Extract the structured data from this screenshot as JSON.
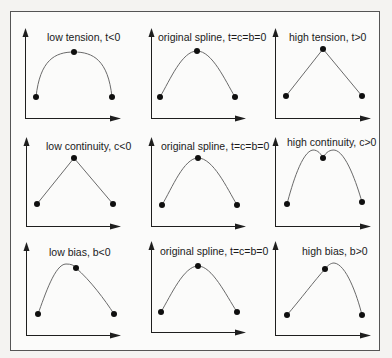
{
  "figure": {
    "frame": {
      "x": 10.5,
      "y": 11.5,
      "w": 369,
      "h": 339
    },
    "colors": {
      "ink": "#1e1e1e",
      "curve": "#6a6a6a",
      "background": "#f4f3f1",
      "frame_fill": "#fbfbfa"
    },
    "panels": [
      {
        "id": "low-tension",
        "label": "low tension, t<0",
        "label_pos": [
          47,
          41
        ],
        "axes": {
          "ox": 25,
          "oy": 118,
          "ytop": 28,
          "xend": 121
        },
        "points": [
          [
            36,
            97
          ],
          [
            74,
            52
          ],
          [
            112,
            97
          ]
        ],
        "curve": "M36,97 C40,60 55,52 74,52 C93,52 108,60 112,97"
      },
      {
        "id": "original-spline-1",
        "label": "original spline, t=c=b=0",
        "label_pos": [
          158,
          41
        ],
        "axes": {
          "ox": 151,
          "oy": 118,
          "ytop": 28,
          "xend": 246
        },
        "points": [
          [
            160,
            97
          ],
          [
            197,
            51
          ],
          [
            235,
            97
          ]
        ],
        "curve": "M160,97 C170,80 182,51 197,51 C212,51 225,80 235,97"
      },
      {
        "id": "high-tension",
        "label": "high tension, t>0",
        "label_pos": [
          289,
          41
        ],
        "axes": {
          "ox": 275,
          "oy": 118,
          "ytop": 28,
          "xend": 371
        },
        "points": [
          [
            286,
            96
          ],
          [
            323,
            49
          ],
          [
            362,
            96
          ]
        ],
        "curve": "M286,96 L323,49 L362,96"
      },
      {
        "id": "low-continuity",
        "label": "low continuity, c<0",
        "label_pos": [
          46,
          150
        ],
        "axes": {
          "ox": 26,
          "oy": 226,
          "ytop": 137,
          "xend": 121
        },
        "points": [
          [
            37,
            204
          ],
          [
            74,
            158
          ],
          [
            113,
            204
          ]
        ],
        "curve": "M37,204 L74,158 L113,204"
      },
      {
        "id": "original-spline-2",
        "label": "original spline, t=c=b=0",
        "label_pos": [
          161,
          150
        ],
        "axes": {
          "ox": 151,
          "oy": 226,
          "ytop": 137,
          "xend": 246
        },
        "points": [
          [
            162,
            205
          ],
          [
            198,
            158
          ],
          [
            237,
            205
          ]
        ],
        "curve": "M162,205 C172,188 184,158 198,158 C213,158 227,188 237,205"
      },
      {
        "id": "high-continuity",
        "label": "high continuity, c>0",
        "label_pos": [
          287,
          146
        ],
        "axes": {
          "ox": 275,
          "oy": 226,
          "ytop": 137,
          "xend": 371
        },
        "points": [
          [
            287,
            204
          ],
          [
            323,
            158
          ],
          [
            362,
            202
          ]
        ],
        "curve": "M287,204 C292,185 302,151 313,150 C318,150 321,154 323,158 C325,154 328,150 334,150 C346,151 357,185 362,202"
      },
      {
        "id": "low-bias",
        "label": "low bias, b<0",
        "label_pos": [
          49,
          256
        ],
        "axes": {
          "ox": 26,
          "oy": 335,
          "ytop": 242,
          "xend": 121
        },
        "points": [
          [
            38,
            314
          ],
          [
            76,
            268
          ],
          [
            114,
            314
          ]
        ],
        "curve": "M38,314 C45,295 55,264 66,264 C71,264 74,265 76,268 C90,280 105,300 114,314"
      },
      {
        "id": "original-spline-3",
        "label": "original spline, t=c=b=0",
        "label_pos": [
          160,
          255
        ],
        "axes": {
          "ox": 151,
          "oy": 332,
          "ytop": 241,
          "xend": 246
        },
        "points": [
          [
            161,
            312
          ],
          [
            198,
            266
          ],
          [
            237,
            312
          ]
        ],
        "curve": "M161,312 C171,295 184,266 198,266 C212,266 226,295 237,312"
      },
      {
        "id": "high-bias",
        "label": "high bias, b>0",
        "label_pos": [
          302,
          255
        ],
        "axes": {
          "ox": 275,
          "oy": 335,
          "ytop": 241,
          "xend": 371
        },
        "points": [
          [
            287,
            315
          ],
          [
            325,
            269
          ],
          [
            362,
            315
          ]
        ],
        "curve": "M287,315 C300,300 315,280 325,269 C328,265 331,263 334,263 C346,264 357,295 362,315"
      }
    ]
  }
}
